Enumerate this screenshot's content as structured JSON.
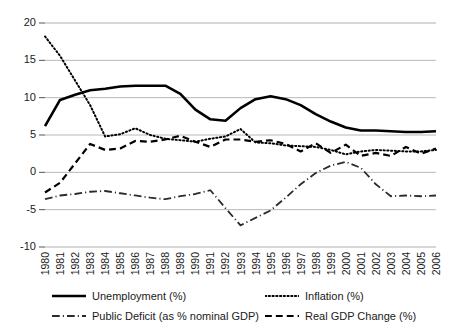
{
  "chart_data": {
    "type": "line",
    "title": "",
    "subtitle": "",
    "xlabel": "",
    "ylabel": "",
    "xlim": [
      1980,
      2006
    ],
    "ylim": [
      -10,
      20
    ],
    "ytick_values": [
      20,
      15,
      10,
      5,
      0,
      -5,
      -10
    ],
    "ytick_labels": [
      "20",
      "15",
      "10",
      "5",
      "0",
      "-5",
      "-10"
    ],
    "grid": true,
    "grid_axis": "y",
    "legend_position": "bottom",
    "categories": [
      "1980",
      "1981",
      "1982",
      "1983",
      "1984",
      "1985",
      "1986",
      "1987",
      "1988",
      "1989",
      "1990",
      "1991",
      "1992",
      "1993",
      "1994",
      "1995",
      "1996",
      "1997",
      "1998",
      "1999",
      "2000",
      "2001",
      "2002",
      "2003",
      "2004",
      "2005",
      "2006"
    ],
    "series": [
      {
        "name": "Unemployment (%)",
        "key": "unemployment",
        "style": "solid",
        "color": "#000000",
        "width": 2.6,
        "values": [
          6.2,
          9.7,
          10.4,
          11.0,
          11.2,
          11.5,
          11.6,
          11.6,
          11.6,
          10.5,
          8.4,
          7.1,
          6.9,
          8.6,
          9.8,
          10.2,
          9.8,
          9.0,
          7.8,
          6.8,
          6.0,
          5.6,
          5.6,
          5.5,
          5.4,
          5.4,
          5.5
        ]
      },
      {
        "name": "Inflation (%)",
        "key": "inflation",
        "style": "dotted",
        "color": "#000000",
        "width": 2.0,
        "values": [
          18.2,
          15.6,
          12.3,
          9.0,
          4.8,
          5.1,
          5.9,
          5.0,
          4.5,
          4.3,
          4.1,
          4.5,
          4.8,
          5.8,
          4.0,
          3.9,
          3.6,
          3.5,
          3.4,
          3.0,
          2.4,
          2.8,
          3.0,
          2.9,
          2.8,
          2.8,
          3.0
        ]
      },
      {
        "name": "Public Deficit (as % nominal GDP)",
        "key": "public_deficit",
        "style": "dashdot",
        "color": "#2b2b2b",
        "width": 1.8,
        "values": [
          -3.6,
          -3.1,
          -2.9,
          -2.6,
          -2.5,
          -2.8,
          -3.1,
          -3.4,
          -3.6,
          -3.2,
          -2.9,
          -2.4,
          -4.8,
          -7.1,
          -6.1,
          -5.1,
          -3.4,
          -1.6,
          -0.1,
          0.9,
          1.4,
          0.6,
          -1.6,
          -3.2,
          -3.1,
          -3.2,
          -3.1
        ]
      },
      {
        "name": "Real GDP Change (%)",
        "key": "real_gdp_change",
        "style": "dashed",
        "color": "#000000",
        "width": 2.2,
        "values": [
          -2.7,
          -1.4,
          1.2,
          3.8,
          3.0,
          3.2,
          4.2,
          4.1,
          4.4,
          4.9,
          4.1,
          3.4,
          4.4,
          4.4,
          4.1,
          4.3,
          3.8,
          2.8,
          3.9,
          2.6,
          3.7,
          2.2,
          2.6,
          2.2,
          3.4,
          2.5,
          3.2
        ]
      }
    ]
  },
  "legend": {
    "items": [
      {
        "label": "Unemployment (%)",
        "style": "solid",
        "name": "legend-item-unemployment"
      },
      {
        "label": "Inflation (%)",
        "style": "dotted",
        "name": "legend-item-inflation"
      },
      {
        "label": "Public Deficit (as % nominal GDP)",
        "style": "dashdot",
        "name": "legend-item-public-deficit"
      },
      {
        "label": "Real GDP Change (%)",
        "style": "dashed",
        "name": "legend-item-real-gdp-change"
      }
    ]
  },
  "colors": {
    "grid": "#b0b0b0",
    "axis_text": "#1a1a1a",
    "background": "#ffffff",
    "line": "#000000"
  }
}
